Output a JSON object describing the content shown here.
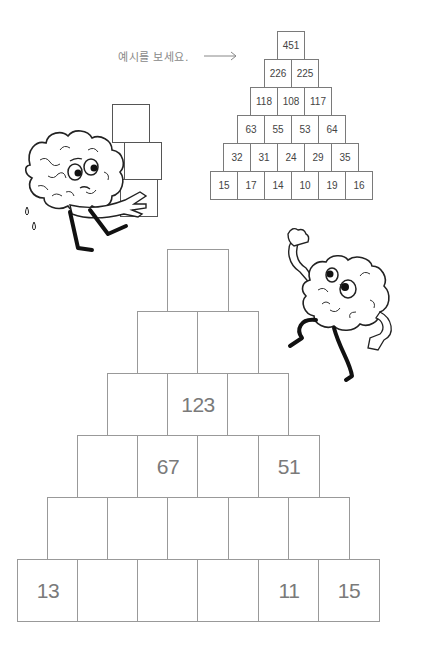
{
  "instruction": {
    "text": "예시를 보세요.",
    "arrow_icon": "right-arrow"
  },
  "example_pyramid": {
    "rows": [
      [
        "451"
      ],
      [
        "226",
        "225"
      ],
      [
        "118",
        "108",
        "117"
      ],
      [
        "63",
        "55",
        "53",
        "64"
      ],
      [
        "32",
        "31",
        "24",
        "29",
        "35"
      ],
      [
        "15",
        "17",
        "14",
        "10",
        "19",
        "16"
      ]
    ]
  },
  "puzzle_pyramid": {
    "rows": [
      [
        ""
      ],
      [
        "",
        ""
      ],
      [
        "",
        "123",
        ""
      ],
      [
        "",
        "67",
        "",
        "51"
      ],
      [
        "",
        "",
        "",
        "",
        ""
      ],
      [
        "13",
        "",
        "",
        "",
        "11",
        "15"
      ]
    ]
  },
  "illustrations": {
    "left_character": "brain-carrying-boxes",
    "right_character": "brain-dancing"
  }
}
